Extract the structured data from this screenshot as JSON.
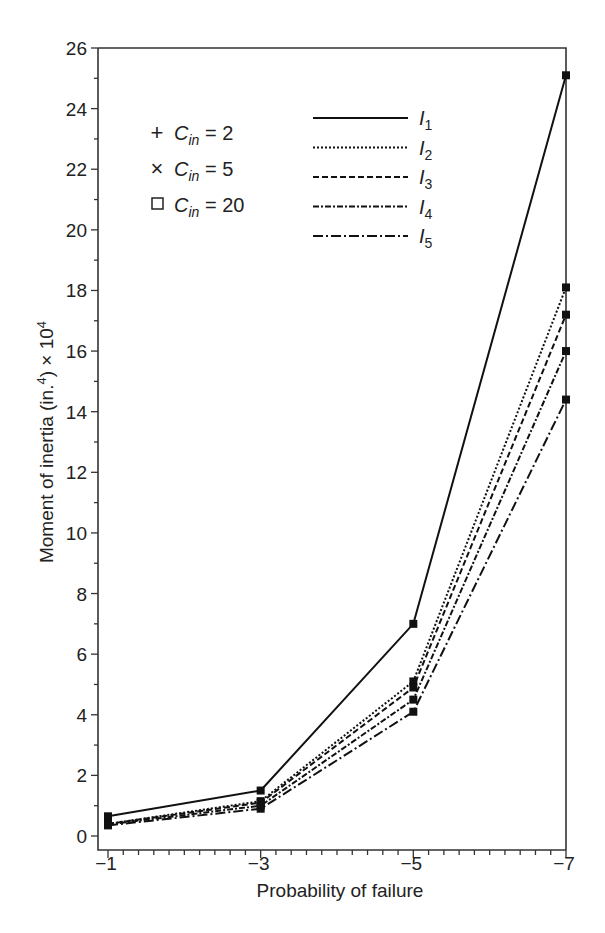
{
  "chart_data": {
    "type": "line",
    "title": "",
    "xlabel": "Probability of failure",
    "ylabel": "Moment of inertia (in.⁴) × 10⁴",
    "ylabel_parts": {
      "main": "Moment of inertia (in.",
      "sup1": "4",
      "mid": ") × 10",
      "sup2": "4"
    },
    "x": [
      -1,
      -3,
      -5,
      -7
    ],
    "x_tick_labels": [
      "−1",
      "−3",
      "−5",
      "−7"
    ],
    "y_tick_labels": [
      "0",
      "2",
      "4",
      "6",
      "8",
      "10",
      "12",
      "14",
      "16",
      "18",
      "20",
      "22",
      "24",
      "26"
    ],
    "ylim": [
      0,
      26
    ],
    "xlim": [
      -1,
      -7
    ],
    "grid": false,
    "series": [
      {
        "name": "I1",
        "label_main": "I",
        "label_sub": "1",
        "dash": "",
        "values": [
          0.65,
          1.5,
          7.0,
          25.1
        ]
      },
      {
        "name": "I2",
        "label_main": "I",
        "label_sub": "2",
        "dash": "2,2",
        "values": [
          0.4,
          1.15,
          5.1,
          18.1
        ]
      },
      {
        "name": "I3",
        "label_main": "I",
        "label_sub": "3",
        "dash": "6,3",
        "values": [
          0.4,
          1.1,
          4.9,
          17.2
        ]
      },
      {
        "name": "I4",
        "label_main": "I",
        "label_sub": "4",
        "dash": "6,2,2,2",
        "values": [
          0.38,
          1.0,
          4.5,
          16.0
        ]
      },
      {
        "name": "I5",
        "label_main": "I",
        "label_sub": "5",
        "dash": "10,3,2,3",
        "values": [
          0.35,
          0.9,
          4.1,
          14.4
        ]
      }
    ],
    "marker_legend": [
      {
        "symbol": "+",
        "label_main": "C",
        "label_sub": "in",
        "value": "= 2"
      },
      {
        "symbol": "×",
        "label_main": "C",
        "label_sub": "in",
        "value": "= 5"
      },
      {
        "symbol": "□",
        "label_main": "C",
        "label_sub": "in",
        "value": "= 20"
      }
    ],
    "legend_position": "upper-left inside plot"
  }
}
